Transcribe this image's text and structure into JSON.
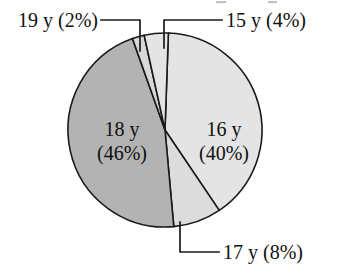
{
  "chart_data": {
    "type": "pie",
    "title": "",
    "subtitle": "",
    "xlabel": "",
    "ylabel": "",
    "legend_position": "none",
    "grid": false,
    "units": "percent",
    "categories": [
      "16 y",
      "17 y",
      "18 y",
      "19 y",
      "15 y"
    ],
    "values": [
      40,
      8,
      46,
      2,
      4
    ],
    "slices": [
      {
        "category": "16 y",
        "value": 40,
        "value_label": "(40%)",
        "label_line1": "16 y",
        "label_line2": "(40%)",
        "label_placement": "inside",
        "color": "#e4e4e4",
        "start_angle": 2.0,
        "end_angle": 146.0
      },
      {
        "category": "17 y",
        "value": 8,
        "value_label": "(8%)",
        "label_line1": "17 y (8%)",
        "label_line2": "",
        "label_placement": "callout-bottom-right",
        "color": "#dcdcdc",
        "start_angle": 146.0,
        "end_angle": 174.8
      },
      {
        "category": "18 y",
        "value": 46,
        "value_label": "(46%)",
        "label_line1": "18 y",
        "label_line2": "(46%)",
        "label_placement": "inside",
        "color": "#b3b3b3",
        "start_angle": 174.8,
        "end_angle": 340.4
      },
      {
        "category": "19 y",
        "value": 2,
        "value_label": "(2%)",
        "label_line1": "19 y (2%)",
        "label_line2": "",
        "label_placement": "callout-top-left",
        "color": "#d8d8d8",
        "start_angle": 340.4,
        "end_angle": 347.6
      },
      {
        "category": "15 y",
        "value": 4,
        "value_label": "(4%)",
        "label_line1": "15 y (4%)",
        "label_line2": "",
        "label_placement": "callout-top-right",
        "color": "#e4e4e4",
        "start_angle": 347.6,
        "end_angle": 362.0
      }
    ]
  },
  "labels": {
    "callout_19y": "19 y (2%)",
    "callout_15y": "15 y (4%)",
    "callout_17y": "17 y (8%)",
    "inside_18y_line1": "18 y",
    "inside_18y_line2": "(46%)",
    "inside_16y_line1": "16 y",
    "inside_16y_line2": "(40%)"
  },
  "colors": {
    "outline": "#1a1a1a",
    "text": "#101010",
    "background": "#ffffff",
    "slice_16y": "#e4e4e4",
    "slice_17y": "#dcdcdc",
    "slice_18y": "#b3b3b3",
    "slice_19y": "#d8d8d8",
    "slice_15y": "#e4e4e4"
  }
}
